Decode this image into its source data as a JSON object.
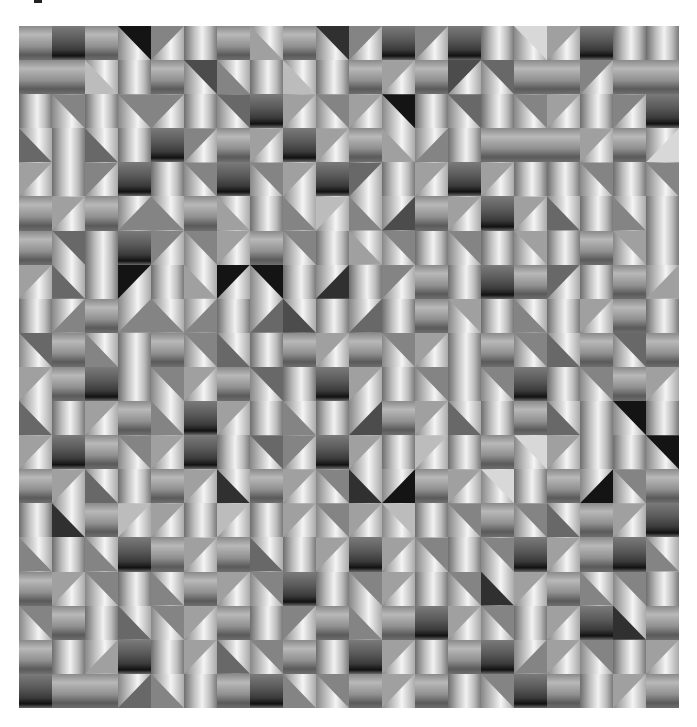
{
  "artwork": {
    "description": "Grayscale op-art mosaic of shaded square tiles",
    "columns": 20,
    "rows": 20,
    "legend": {
      "V": "vertical cylinder shading (light center)",
      "H": "horizontal band shading",
      "D": "dark horizontal band",
      "A": "diagonal split, flat triangle top-right",
      "B": "diagonal split, flat triangle top-left",
      "C": "diagonal split, flat triangle bottom-left",
      "E": "diagonal split, flat triangle bottom-right",
      "tone": "digit 1 (black) to 9 (near white) for flat triangle or band tone"
    },
    "grid": [
      [
        "H5",
        "D4",
        "H5",
        "A1",
        "B5",
        "V8",
        "H4",
        "C6",
        "H5",
        "A2",
        "B5",
        "D3",
        "B5",
        "D2",
        "V7",
        "A8",
        "B6",
        "D3",
        "V8",
        "V9"
      ],
      [
        "H4",
        "H4",
        "C7",
        "V8",
        "H5",
        "A3",
        "C5",
        "V8",
        "C7",
        "V8",
        "H5",
        "B6",
        "H5",
        "B3",
        "A4",
        "H5",
        "H5",
        "B5",
        "H6",
        "H5"
      ],
      [
        "V8",
        "A5",
        "V8",
        "A5",
        "B5",
        "V8",
        "A4",
        "D3",
        "B6",
        "A5",
        "B6",
        "A1",
        "V8",
        "A4",
        "V8",
        "A5",
        "B6",
        "V9",
        "B5",
        "D3"
      ],
      [
        "C4",
        "V8",
        "C4",
        "V8",
        "D4",
        "B5",
        "H5",
        "B6",
        "D4",
        "B6",
        "H5",
        "C6",
        "E5",
        "V8",
        "H7",
        "H5",
        "H5",
        "B6",
        "H6",
        "E8"
      ],
      [
        "B6",
        "V8",
        "B5",
        "D3",
        "V8",
        "A5",
        "D3",
        "A5",
        "B6",
        "D2",
        "B4",
        "V9",
        "B6",
        "D3",
        "B6",
        "V8",
        "V8",
        "A5",
        "V8",
        "A5"
      ],
      [
        "H5",
        "B6",
        "H6",
        "E5",
        "C5",
        "H5",
        "C6",
        "V8",
        "C5",
        "B7",
        "C5",
        "E3",
        "H6",
        "B6",
        "D4",
        "B6",
        "C4",
        "V8",
        "C5",
        "V8"
      ],
      [
        "H5",
        "A4",
        "V8",
        "D4",
        "B5",
        "A5",
        "B6",
        "H5",
        "A5",
        "V8",
        "C6",
        "A5",
        "V8",
        "A5",
        "V8",
        "A6",
        "V8",
        "H5",
        "A6",
        "V8"
      ],
      [
        "B6",
        "C4",
        "V8",
        "B1",
        "V8",
        "C6",
        "B1",
        "A1",
        "V8",
        "E2",
        "V8",
        "B5",
        "H6",
        "V8",
        "D4",
        "H5",
        "B4",
        "V8",
        "H5",
        "E6"
      ],
      [
        "V8",
        "E5",
        "H4",
        "E5",
        "C5",
        "E5",
        "V8",
        "E4",
        "C3",
        "V8",
        "E4",
        "V8",
        "H6",
        "A6",
        "V8",
        "C5",
        "V8",
        "B6",
        "H5",
        "V8"
      ],
      [
        "A4",
        "H5",
        "C5",
        "V8",
        "H5",
        "A5",
        "C4",
        "V8",
        "H5",
        "B6",
        "H4",
        "A5",
        "B6",
        "V8",
        "H6",
        "A5",
        "C4",
        "H5",
        "A4",
        "H6"
      ],
      [
        "B6",
        "H5",
        "D4",
        "V8",
        "A5",
        "B6",
        "H5",
        "A4",
        "V8",
        "D3",
        "B6",
        "V8",
        "A5",
        "V8",
        "A5",
        "D4",
        "V8",
        "A5",
        "H5",
        "B6"
      ],
      [
        "C4",
        "V8",
        "B6",
        "H5",
        "C5",
        "D4",
        "B6",
        "V8",
        "C5",
        "V8",
        "E3",
        "H5",
        "B6",
        "C4",
        "V8",
        "H5",
        "C4",
        "V8",
        "A1",
        "V8"
      ],
      [
        "B6",
        "D3",
        "H5",
        "A5",
        "B6",
        "D2",
        "V8",
        "A4",
        "B5",
        "D2",
        "B6",
        "V8",
        "B7",
        "V9",
        "H4",
        "A8",
        "B6",
        "V9",
        "V8",
        "A1"
      ],
      [
        "H6",
        "B6",
        "C4",
        "V8",
        "H4",
        "B6",
        "C2",
        "H4",
        "B6",
        "A5",
        "C2",
        "E1",
        "H6",
        "B6",
        "A8",
        "V8",
        "H5",
        "E1",
        "A5",
        "H5"
      ],
      [
        "V8",
        "C2",
        "H6",
        "B7",
        "B6",
        "V8",
        "B7",
        "V8",
        "B6",
        "A5",
        "B6",
        "A7",
        "V8",
        "A5",
        "H4",
        "A5",
        "C4",
        "H6",
        "B6",
        "D3"
      ],
      [
        "C5",
        "V8",
        "C5",
        "D3",
        "H5",
        "B6",
        "H6",
        "C4",
        "V8",
        "B6",
        "D3",
        "B6",
        "A5",
        "V8",
        "A5",
        "D4",
        "B6",
        "H5",
        "D4",
        "C5"
      ],
      [
        "H6",
        "B6",
        "A5",
        "V8",
        "C5",
        "H5",
        "B6",
        "A5",
        "D3",
        "V8",
        "A5",
        "B6",
        "V8",
        "A5",
        "C2",
        "B6",
        "H5",
        "C5",
        "A5",
        "V8"
      ],
      [
        "A5",
        "H5",
        "V8",
        "C4",
        "A5",
        "B6",
        "H5",
        "V8",
        "B5",
        "H5",
        "C5",
        "H6",
        "D3",
        "B6",
        "A5",
        "V8",
        "B6",
        "D4",
        "C2",
        "H5"
      ],
      [
        "H5",
        "V8",
        "E6",
        "D2",
        "V8",
        "B6",
        "C4",
        "A5",
        "H5",
        "V8",
        "D3",
        "B6",
        "V8",
        "H5",
        "D4",
        "E5",
        "B6",
        "A5",
        "V8",
        "B6"
      ],
      [
        "D3",
        "H4",
        "H5",
        "E4",
        "C5",
        "V8",
        "H4",
        "D4",
        "C5",
        "A5",
        "H5",
        "B6",
        "H5",
        "V8",
        "A5",
        "D3",
        "H5",
        "V8",
        "B6",
        "H5"
      ]
    ]
  }
}
